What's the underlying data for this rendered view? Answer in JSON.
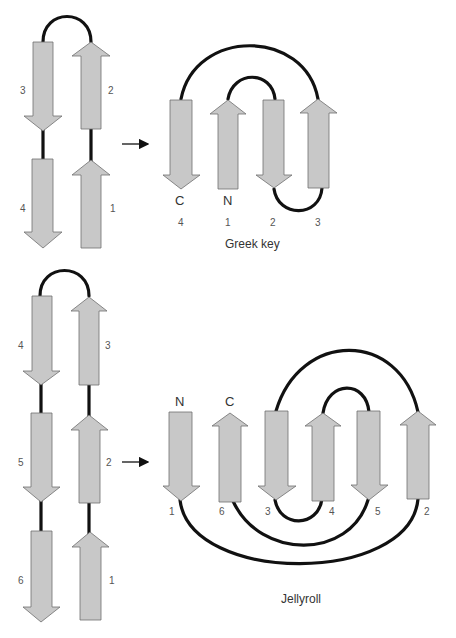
{
  "greek_key": {
    "title": "Greek key",
    "left_panel": {
      "strands": [
        {
          "label": "3",
          "direction": "down"
        },
        {
          "label": "2",
          "direction": "up"
        },
        {
          "label": "4",
          "direction": "down"
        },
        {
          "label": "1",
          "direction": "up"
        }
      ]
    },
    "right_panel": {
      "termini": {
        "c": "C",
        "n": "N"
      },
      "strand_order": [
        "4",
        "1",
        "2",
        "3"
      ]
    }
  },
  "jellyroll": {
    "title": "Jellyroll",
    "left_panel": {
      "strands": [
        {
          "label": "4",
          "direction": "down"
        },
        {
          "label": "3",
          "direction": "up"
        },
        {
          "label": "5",
          "direction": "down"
        },
        {
          "label": "2",
          "direction": "up"
        },
        {
          "label": "6",
          "direction": "down"
        },
        {
          "label": "1",
          "direction": "up"
        }
      ]
    },
    "right_panel": {
      "termini": {
        "n": "N",
        "c": "C"
      },
      "strand_order": [
        "1",
        "6",
        "3",
        "4",
        "5",
        "2"
      ]
    }
  },
  "colors": {
    "strand_fill": "#c8c8c8",
    "loop": "#111111",
    "text": "#333333"
  }
}
